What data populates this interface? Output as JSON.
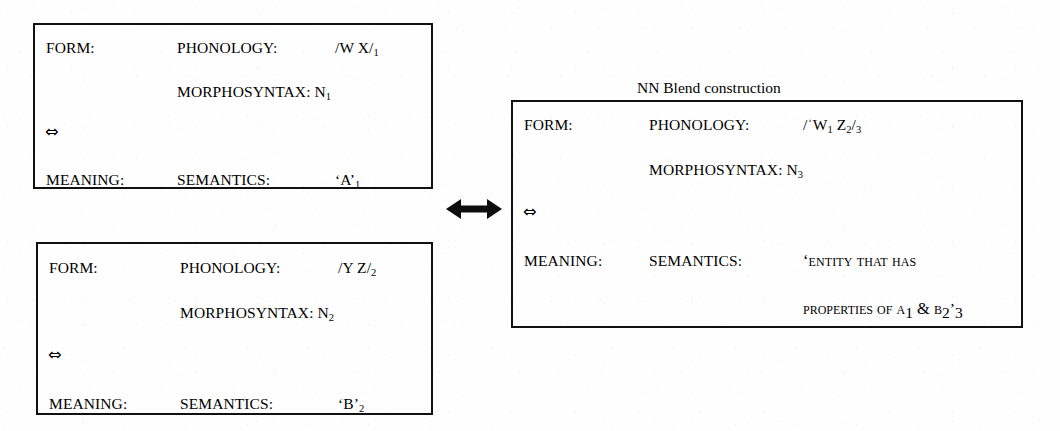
{
  "diagram": {
    "caption": "NN Blend construction",
    "arrow_icon": "double-headed-arrow",
    "link_glyph": "⇔",
    "labels": {
      "form": "FORM:",
      "meaning": "MEANING:",
      "phonology": "PHONOLOGY:",
      "semantics": "SEMANTICS:"
    },
    "boxes": [
      {
        "id": "source-1",
        "name": "input-sign-1",
        "form_label": "FORM:",
        "phonology_label": "PHONOLOGY:",
        "phonology_value": "/W X/",
        "phonology_index": "1",
        "morphosyntax": "MORPHOSYNTAX: N",
        "morphosyntax_index": "1",
        "link": "⇔",
        "meaning_label": "MEANING:",
        "semantics_label": "SEMANTICS:",
        "semantics_value": "‘A’",
        "semantics_index": "1"
      },
      {
        "id": "source-2",
        "name": "input-sign-2",
        "form_label": "FORM:",
        "phonology_label": "PHONOLOGY:",
        "phonology_value": "/Y Z/",
        "phonology_index": "2",
        "morphosyntax": "MORPHOSYNTAX: N",
        "morphosyntax_index": "2",
        "link": "⇔",
        "meaning_label": "MEANING:",
        "semantics_label": "SEMANTICS:",
        "semantics_value": "‘B’",
        "semantics_index": "2"
      },
      {
        "id": "target",
        "name": "blend-construction-sign",
        "form_label": "FORM:",
        "phonology_label": "PHONOLOGY:",
        "phonology_open": "/ˈW",
        "phonology_sub_1": "1",
        "phonology_mid": "Z",
        "phonology_sub_2": "2",
        "phonology_close": "/",
        "phonology_index": "3",
        "morphosyntax": "MORPHOSYNTAX: N",
        "morphosyntax_index": "3",
        "link": "⇔",
        "meaning_label": "MEANING:",
        "semantics_label": "SEMANTICS:",
        "semantics_line_1": "‘ENTITY THAT HAS",
        "semantics_line_2_a": "PROPERTIES OF A",
        "semantics_line_2_sub_a": "1",
        "semantics_line_2_b": "& B",
        "semantics_line_2_sub_b": "2",
        "semantics_line_2_close": "’",
        "semantics_index": "3"
      }
    ]
  }
}
